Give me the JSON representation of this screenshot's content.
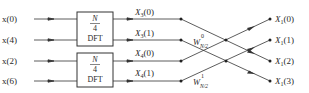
{
  "diagram": {
    "type": "signal-flow",
    "title": "",
    "inputs": [
      "x(0)",
      "x(4)",
      "x(2)",
      "x(6)"
    ],
    "blocks": [
      {
        "num": "N",
        "den": "4",
        "label": "DFT"
      },
      {
        "num": "N",
        "den": "4",
        "label": "DFT"
      }
    ],
    "intermediate": [
      {
        "base": "X",
        "sub": "3",
        "arg": "(0)"
      },
      {
        "base": "X",
        "sub": "3",
        "arg": "(1)"
      },
      {
        "base": "X",
        "sub": "4",
        "arg": "(0)"
      },
      {
        "base": "X",
        "sub": "4",
        "arg": "(1)"
      }
    ],
    "twiddles": [
      {
        "base": "W",
        "sub": "N/2",
        "sup": "0"
      },
      {
        "base": "W",
        "sub": "N/2",
        "sup": "1"
      }
    ],
    "outputs": [
      {
        "base": "X",
        "sub": "1",
        "arg": "(0)"
      },
      {
        "base": "X",
        "sub": "1",
        "arg": "(1)"
      },
      {
        "base": "X",
        "sub": "1",
        "arg": "(2)"
      },
      {
        "base": "X",
        "sub": "1",
        "arg": "(3)"
      }
    ],
    "colors": {
      "line": "#333333",
      "background": "#ffffff"
    }
  }
}
